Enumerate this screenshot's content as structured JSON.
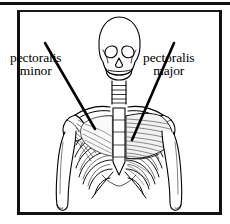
{
  "figure": {
    "background_color": "#ffffff",
    "line_color": "#000000",
    "frame": {
      "style": "double-rule-black-border",
      "color": "#111111"
    }
  },
  "labels": [
    {
      "id": "pectoralis-minor",
      "line1": "pectoralis",
      "line2": "minor",
      "side": "left",
      "leader_line": "diagonal-pointer-to-left-shoulder"
    },
    {
      "id": "pectoralis-major",
      "line1": "pectoralis",
      "line2": "major",
      "side": "right",
      "leader_line": "diagonal-pointer-to-right-pectoral-muscle"
    }
  ],
  "anatomy": {
    "parts": [
      "skull",
      "mandible",
      "cervical-vertebrae",
      "clavicle",
      "scapula",
      "sternum",
      "ribcage",
      "humerus-left",
      "humerus-right",
      "pectoralis-major-muscle",
      "pectoralis-minor-muscle"
    ]
  }
}
